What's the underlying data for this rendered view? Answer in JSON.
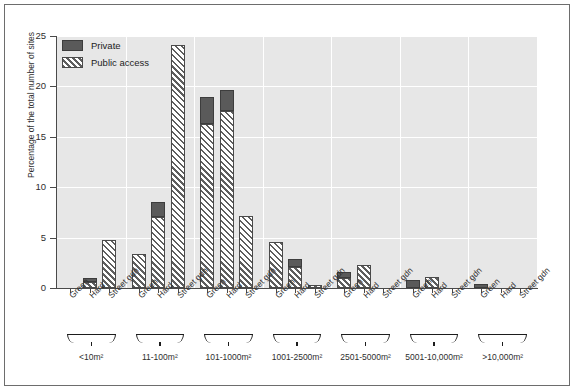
{
  "chart_data": {
    "type": "bar",
    "title": "",
    "xlabel": "",
    "ylabel": "Percentage of the total number of sites",
    "ylim": [
      0,
      25
    ],
    "yticks": [
      0,
      5,
      10,
      15,
      20,
      25
    ],
    "grid": "horizontal and vertical white gridlines",
    "legend": {
      "position": "top-left inside plot",
      "entries": [
        {
          "name": "Private",
          "style": "solid dark grey fill",
          "color": "#5a5a5a"
        },
        {
          "name": "Public access",
          "style": "diagonal hatch fill",
          "color": "#5e5e5e"
        }
      ]
    },
    "categories": [
      "Green",
      "Hard",
      "Street gdn"
    ],
    "groups": [
      {
        "label": "<10m²",
        "bars": [
          {
            "category": "Green",
            "public": 0.0,
            "private": 0.0,
            "total": 0.0
          },
          {
            "category": "Hard",
            "public": 0.6,
            "private": 0.4,
            "total": 1.0
          },
          {
            "category": "Street gdn",
            "public": 4.8,
            "private": 0.0,
            "total": 4.8
          }
        ]
      },
      {
        "label": "11-100m²",
        "bars": [
          {
            "category": "Green",
            "public": 3.4,
            "private": 0.0,
            "total": 3.4
          },
          {
            "category": "Hard",
            "public": 7.0,
            "private": 1.5,
            "total": 8.5
          },
          {
            "category": "Street gdn",
            "public": 24.1,
            "private": 0.0,
            "total": 24.1
          }
        ]
      },
      {
        "label": "101-1000m²",
        "bars": [
          {
            "category": "Green",
            "public": 16.3,
            "private": 2.6,
            "total": 18.9
          },
          {
            "category": "Hard",
            "public": 17.6,
            "private": 2.0,
            "total": 19.6
          },
          {
            "category": "Street gdn",
            "public": 7.1,
            "private": 0.0,
            "total": 7.1
          }
        ]
      },
      {
        "label": "1001-2500m²",
        "bars": [
          {
            "category": "Green",
            "public": 4.6,
            "private": 0.0,
            "total": 4.6
          },
          {
            "category": "Hard",
            "public": 2.1,
            "private": 0.8,
            "total": 2.9
          },
          {
            "category": "Street gdn",
            "public": 0.3,
            "private": 0.0,
            "total": 0.3
          }
        ]
      },
      {
        "label": "2501-5000m²",
        "bars": [
          {
            "category": "Green",
            "public": 1.0,
            "private": 0.6,
            "total": 1.6
          },
          {
            "category": "Hard",
            "public": 2.3,
            "private": 0.0,
            "total": 2.3
          },
          {
            "category": "Street gdn",
            "public": 0.0,
            "private": 0.0,
            "total": 0.0
          }
        ]
      },
      {
        "label": "5001-10,000m²",
        "bars": [
          {
            "category": "Green",
            "public": 0.0,
            "private": 0.8,
            "total": 0.8
          },
          {
            "category": "Hard",
            "public": 1.1,
            "private": 0.0,
            "total": 1.1
          },
          {
            "category": "Street gdn",
            "public": 0.0,
            "private": 0.0,
            "total": 0.0
          }
        ]
      },
      {
        "label": ">10,000m²",
        "bars": [
          {
            "category": "Green",
            "public": 0.0,
            "private": 0.4,
            "total": 0.4
          },
          {
            "category": "Hard",
            "public": 0.0,
            "private": 0.0,
            "total": 0.0
          },
          {
            "category": "Street gdn",
            "public": 0.0,
            "private": 0.0,
            "total": 0.0
          }
        ]
      }
    ]
  },
  "axis": {
    "y_title": "Percentage of the total number of sites",
    "y_tick_labels": [
      "0",
      "5",
      "10",
      "15",
      "20",
      "25"
    ]
  },
  "legend": {
    "private_label": "Private",
    "public_label": "Public access"
  },
  "colors": {
    "plot_background": "#e7e7e7",
    "gridline": "#ffffff",
    "axis": "#4a4a4a",
    "private_fill": "#5a5a5a",
    "hatch_stroke": "#5e5e5e",
    "frame": "#6d6d6d"
  }
}
